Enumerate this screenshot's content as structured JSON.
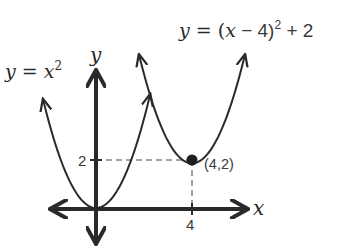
{
  "colors": {
    "background": "#ffffff",
    "curve": "#2a2a2a",
    "axis": "#2a2a2a",
    "guide": "#888888",
    "text": "#2a2a2a"
  },
  "axes": {
    "x_label": "x",
    "y_label": "y",
    "x_ticks": [
      {
        "value": 4,
        "label": "4"
      }
    ],
    "y_ticks": [
      {
        "value": 2,
        "label": "2"
      }
    ],
    "origin_px": [
      96,
      208
    ],
    "px_per_unit": 24
  },
  "curves": [
    {
      "name": "parent",
      "label_parts": {
        "y": "y",
        "eq": " = ",
        "x": "x",
        "exp": "2"
      },
      "equation": "y = x^2",
      "vertex": [
        0,
        0
      ],
      "x_range": [
        -2.2,
        2.25
      ]
    },
    {
      "name": "translated",
      "label_parts": {
        "y": "y",
        "eq": " = (",
        "x": "x",
        "rest": " − 4)",
        "exp": "2",
        "tail": " + 2"
      },
      "equation": "y = (x - 4)^2 + 2",
      "vertex": [
        4,
        2
      ],
      "x_range": [
        1.8,
        6.2
      ]
    }
  ],
  "point": {
    "x": 4,
    "y": 2,
    "label": "(4,2)"
  },
  "chart_data": {
    "type": "line",
    "title": "",
    "xlabel": "x",
    "ylabel": "y",
    "series": [
      {
        "name": "y = x^2",
        "x": [
          -2,
          -1,
          0,
          1,
          2
        ],
        "values": [
          4,
          1,
          0,
          1,
          4
        ]
      },
      {
        "name": "y = (x - 4)^2 + 2",
        "x": [
          2,
          3,
          4,
          5,
          6
        ],
        "values": [
          6,
          3,
          2,
          3,
          6
        ]
      }
    ],
    "annotations": [
      {
        "x": 4,
        "y": 2,
        "text": "(4,2)"
      }
    ],
    "grid": false,
    "legend": "inline labels"
  }
}
